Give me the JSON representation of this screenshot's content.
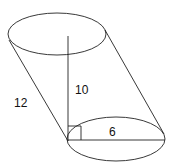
{
  "diagram": {
    "type": "oblique-cylinder",
    "labels": {
      "slant_height": "12",
      "height": "10",
      "radius": "6"
    },
    "stroke_color": "#222222",
    "background": "#ffffff"
  }
}
